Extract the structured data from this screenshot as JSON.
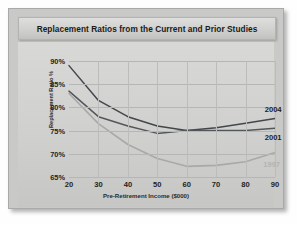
{
  "card": {
    "title": "Replacement Ratios from the Current and Prior Studies"
  },
  "chart_data": {
    "type": "line",
    "title": "Replacement Ratios from the Current and Prior Studies",
    "xlabel": "Pre-Retirement Income ($000)",
    "ylabel": "Replacement Ratio %",
    "x": [
      20,
      30,
      40,
      50,
      60,
      70,
      80,
      90
    ],
    "xticklabels": [
      "20",
      "30",
      "40",
      "50",
      "60",
      "70",
      "80",
      "90"
    ],
    "yticks": [
      65,
      70,
      75,
      80,
      85,
      90
    ],
    "yticklabels": [
      "65%",
      "70%",
      "75%",
      "80%",
      "85%",
      "90%"
    ],
    "xlim": [
      20,
      90
    ],
    "ylim": [
      65,
      90
    ],
    "grid": true,
    "legend_position": "inline-right",
    "series": [
      {
        "name": "2004",
        "color": "#43474b",
        "values": [
          89.0,
          81.5,
          78.0,
          76.0,
          75.0,
          75.6,
          76.6,
          77.6
        ],
        "label_x": 86.5,
        "label_y": 79.4
      },
      {
        "name": "2001",
        "color": "#53575b",
        "values": [
          83.5,
          78.0,
          76.0,
          74.4,
          75.0,
          75.0,
          75.0,
          75.5
        ],
        "label_x": 86.5,
        "label_y": 73.4
      },
      {
        "name": "1997",
        "color": "#a9a9a7",
        "values": [
          83.0,
          76.5,
          72.0,
          69.0,
          67.3,
          67.5,
          68.3,
          70.3
        ],
        "label_x": 86.0,
        "label_y": 67.6
      }
    ]
  }
}
